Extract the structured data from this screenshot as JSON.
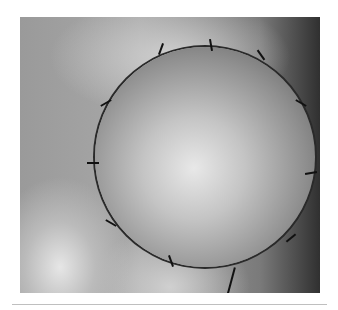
{
  "figure": {
    "type": "clinical-photograph",
    "has_caption": false
  }
}
